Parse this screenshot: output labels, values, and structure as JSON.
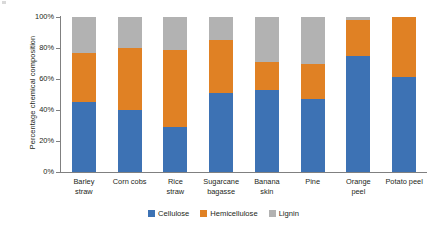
{
  "chart_data": {
    "type": "bar",
    "subtype": "stacked-percentage",
    "title": "",
    "xlabel": "",
    "ylabel": "Percentage chemical composition",
    "ylim": [
      0,
      100
    ],
    "yticks": [
      "0%",
      "20%",
      "40%",
      "60%",
      "80%",
      "100%"
    ],
    "ytick_values": [
      0,
      20,
      40,
      60,
      80,
      100
    ],
    "grid": false,
    "legend_position": "bottom",
    "categories": [
      "Barley straw",
      "Corn cobs",
      "Rice straw",
      "Sugarcane bagasse",
      "Banana skin",
      "Pine",
      "Orange peel",
      "Potato peel"
    ],
    "category_lines": [
      [
        "Barley",
        "straw"
      ],
      [
        "Corn cobs",
        ""
      ],
      [
        "Rice",
        "straw"
      ],
      [
        "Sugarcane",
        "bagasse"
      ],
      [
        "Banana",
        "skin"
      ],
      [
        "Pine",
        ""
      ],
      [
        "Orange",
        "peel"
      ],
      [
        "Potato peel",
        ""
      ]
    ],
    "series": [
      {
        "name": "Cellulose",
        "color": "#3d72b4",
        "values": [
          45,
          40,
          29,
          51,
          53,
          47,
          75,
          61
        ]
      },
      {
        "name": "Hemicellulose",
        "color": "#e08124",
        "values": [
          32,
          40,
          50,
          34,
          18,
          23,
          23,
          39
        ]
      },
      {
        "name": "Lignin",
        "color": "#b2b2b2",
        "values": [
          23,
          20,
          21,
          15,
          29,
          30,
          2,
          0
        ]
      }
    ]
  },
  "axis": {
    "y_title": "Percentage chemical composition",
    "tick_labels": [
      "100%",
      "80%",
      "60%",
      "40%",
      "20%",
      "0%"
    ]
  },
  "legend": {
    "items": [
      {
        "label": "Cellulose",
        "color": "#3d72b4"
      },
      {
        "label": "Hemicellulose",
        "color": "#e08124"
      },
      {
        "label": "Lignin",
        "color": "#b2b2b2"
      }
    ]
  }
}
